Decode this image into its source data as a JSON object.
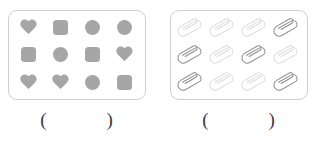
{
  "page": {
    "background_color": "#ffffff"
  },
  "styles": {
    "shape_fill": "#a6a6a6",
    "box_border": "#cfcfcf",
    "clip_stroke_dark": "#8c8c8c",
    "clip_stroke_light": "#dcdcdc",
    "paren_color": "#3a3a3a"
  },
  "groups": [
    {
      "id": "shapes-group",
      "name": "shapes-box",
      "item_type": "shape",
      "rows": 3,
      "columns": 4,
      "count": 12,
      "items": [
        {
          "shape": "heart",
          "name": "heart-shape"
        },
        {
          "shape": "square",
          "name": "square-shape"
        },
        {
          "shape": "circle",
          "name": "circle-shape"
        },
        {
          "shape": "circle",
          "name": "circle-shape"
        },
        {
          "shape": "square",
          "name": "square-shape"
        },
        {
          "shape": "circle",
          "name": "circle-shape"
        },
        {
          "shape": "square",
          "name": "square-shape"
        },
        {
          "shape": "heart",
          "name": "heart-shape"
        },
        {
          "shape": "heart",
          "name": "heart-shape"
        },
        {
          "shape": "heart",
          "name": "heart-shape"
        },
        {
          "shape": "circle",
          "name": "circle-shape"
        },
        {
          "shape": "square",
          "name": "square-shape"
        }
      ],
      "answer": {
        "open_paren": "(",
        "close_paren": ")",
        "value": ""
      }
    },
    {
      "id": "paperclips-group",
      "name": "paperclips-box",
      "item_type": "paperclip",
      "rows": 3,
      "columns": 4,
      "count": 12,
      "items": [
        {
          "shape": "paperclip",
          "name": "paperclip-icon",
          "tone": "light"
        },
        {
          "shape": "paperclip",
          "name": "paperclip-icon",
          "tone": "light"
        },
        {
          "shape": "paperclip",
          "name": "paperclip-icon",
          "tone": "light"
        },
        {
          "shape": "paperclip",
          "name": "paperclip-icon",
          "tone": "dark"
        },
        {
          "shape": "paperclip",
          "name": "paperclip-icon",
          "tone": "dark"
        },
        {
          "shape": "paperclip",
          "name": "paperclip-icon",
          "tone": "light"
        },
        {
          "shape": "paperclip",
          "name": "paperclip-icon",
          "tone": "dark"
        },
        {
          "shape": "paperclip",
          "name": "paperclip-icon",
          "tone": "light"
        },
        {
          "shape": "paperclip",
          "name": "paperclip-icon",
          "tone": "dark"
        },
        {
          "shape": "paperclip",
          "name": "paperclip-icon",
          "tone": "light"
        },
        {
          "shape": "paperclip",
          "name": "paperclip-icon",
          "tone": "light"
        },
        {
          "shape": "paperclip",
          "name": "paperclip-icon",
          "tone": "dark"
        }
      ],
      "answer": {
        "open_paren": "(",
        "close_paren": ")",
        "value": ""
      }
    }
  ]
}
